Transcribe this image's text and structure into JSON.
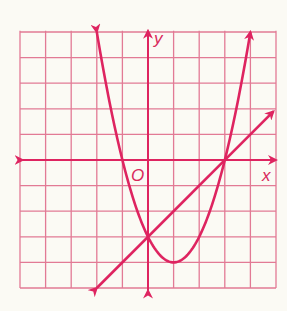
{
  "chart_data": {
    "type": "line",
    "title": "",
    "xlabel": "x",
    "ylabel": "y",
    "origin_label": "O",
    "xlim": [
      -5,
      5
    ],
    "ylim": [
      -5,
      5
    ],
    "grid": true,
    "grid_step": 1,
    "tick_labels": false,
    "series": [
      {
        "name": "parabola",
        "equation": "y = x^2 - 2x - 3",
        "x": [
          -2,
          -1,
          0,
          1,
          2,
          3,
          4
        ],
        "y": [
          5,
          0,
          -3,
          -4,
          -3,
          0,
          5
        ],
        "arrows": "both ends"
      },
      {
        "name": "line",
        "equation": "y = x - 3",
        "x": [
          -2,
          0,
          3,
          4.9
        ],
        "y": [
          -5,
          -3,
          0,
          1.9
        ],
        "arrows": "both ends"
      }
    ],
    "intersections": [
      [
        0,
        -3
      ],
      [
        3,
        0
      ]
    ],
    "annotations": [
      "O",
      "x",
      "y"
    ]
  },
  "labels": {
    "x_axis": "x",
    "y_axis": "y",
    "origin": "O"
  },
  "colors": {
    "curve": "#de2460",
    "grid": "#e27a95",
    "background": "#fbfaf4"
  }
}
